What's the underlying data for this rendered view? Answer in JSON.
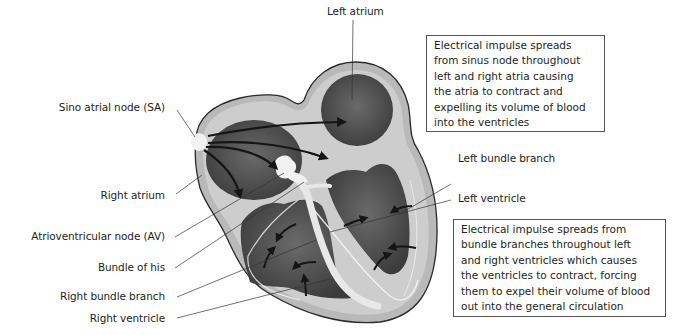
{
  "diagram": {
    "colors": {
      "background": "#ffffff",
      "outer_wall": "#b9b9b9",
      "inner_wall": "#d2d2d2",
      "chamber": "#5a5a5a",
      "chamber_dark": "#3a3a3a",
      "node": "#f2f2f2",
      "outline": "#2a2a2a",
      "arrow": "#1a1a1a",
      "leader_line": "#333333",
      "box_border": "#555555"
    },
    "labels": {
      "left_atrium": "Left atrium",
      "sino_atrial_node": "Sino atrial node (SA)",
      "right_atrium": "Right atrium",
      "av_node": "Atrioventricular node (AV)",
      "bundle_of_his": "Bundle of his",
      "right_bundle_branch": "Right bundle branch",
      "right_ventricle": "Right ventricle",
      "left_bundle_branch": "Left bundle branch",
      "left_ventricle": "Left ventricle"
    },
    "callouts": {
      "atria": {
        "lines": [
          "Electrical impulse spreads",
          "from sinus node throughout",
          "left and right atria causing",
          "the atria to contract and",
          "expelling its volume of blood",
          "into the ventricles"
        ]
      },
      "ventricles": {
        "lines": [
          "Electrical impulse spreads from",
          "bundle branches throughout left",
          "and right ventricles which causes",
          "the ventricles to contract, forcing",
          "them to expel their volume of blood",
          "out into the general circulation"
        ]
      }
    }
  }
}
